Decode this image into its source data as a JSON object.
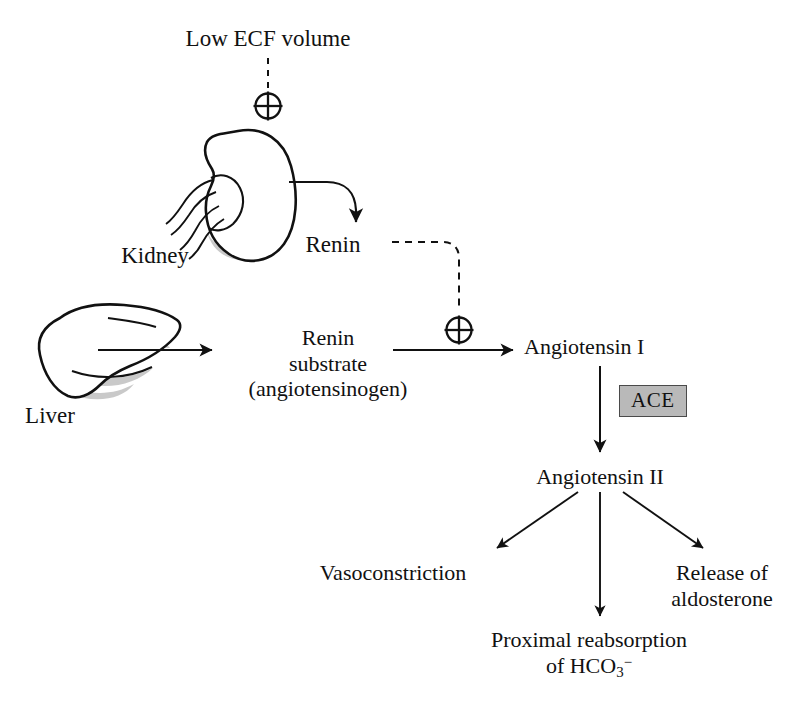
{
  "diagram": {
    "colors": {
      "stroke": "#111111",
      "organ_shading": "#c9c9c9",
      "ace_fill": "#b9b9b9",
      "ace_border": "#4a4a4a",
      "background": "#ffffff"
    },
    "nodes": {
      "low_ecf_volume": "Low ECF volume",
      "kidney": "Kidney",
      "renin": "Renin",
      "liver": "Liver",
      "renin_substrate_line1": "Renin",
      "renin_substrate_line2": "substrate",
      "renin_substrate_line3": "(angiotensinogen)",
      "angiotensin_i": "Angiotensin I",
      "ace": "ACE",
      "angiotensin_ii": "Angiotensin II",
      "vasoconstriction": "Vasoconstriction",
      "release_line1": "Release of",
      "release_line2": "aldosterone",
      "proximal_line1": "Proximal reabsorption",
      "proximal_line2_prefix": "of HCO",
      "proximal_line2_sub": "3",
      "proximal_line2_sup": "−"
    },
    "symbols": {
      "stimulation_ecf": "⊕",
      "stimulation_substrate": "⊕"
    },
    "connections": [
      {
        "from": "low_ecf_volume",
        "to": "kidney",
        "style": "dashed",
        "marker": "plus-circle"
      },
      {
        "from": "kidney",
        "to": "renin",
        "style": "solid-curved",
        "marker": "arrow"
      },
      {
        "from": "renin",
        "to": "renin_substrate_arrow",
        "style": "dashed",
        "marker": "plus-circle"
      },
      {
        "from": "liver",
        "to": "renin_substrate",
        "style": "solid",
        "marker": "arrow"
      },
      {
        "from": "renin_substrate",
        "to": "angiotensin_i",
        "style": "solid",
        "marker": "arrow"
      },
      {
        "from": "angiotensin_i",
        "to": "angiotensin_ii",
        "style": "solid",
        "marker": "arrow",
        "enzyme": "ACE"
      },
      {
        "from": "angiotensin_ii",
        "to": "vasoconstriction",
        "style": "solid",
        "marker": "arrow"
      },
      {
        "from": "angiotensin_ii",
        "to": "proximal_reabsorption",
        "style": "solid",
        "marker": "arrow"
      },
      {
        "from": "angiotensin_ii",
        "to": "release_of_aldosterone",
        "style": "solid",
        "marker": "arrow"
      }
    ]
  }
}
